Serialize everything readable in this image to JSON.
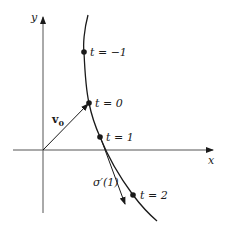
{
  "axes": {
    "x_label": "x",
    "y_label": "y"
  },
  "points": [
    {
      "label": "t = −1",
      "t": -1
    },
    {
      "label": "t = 0",
      "t": 0
    },
    {
      "label": "t = 1",
      "t": 1
    },
    {
      "label": "t = 2",
      "t": 2
    }
  ],
  "vectors": {
    "initial_position": {
      "label": "v",
      "subscript": "0"
    },
    "tangent": {
      "label": "σ′(1)"
    }
  },
  "colors": {
    "ink": "#1a1a1a",
    "axis": "#555555",
    "background": "#ffffff"
  }
}
